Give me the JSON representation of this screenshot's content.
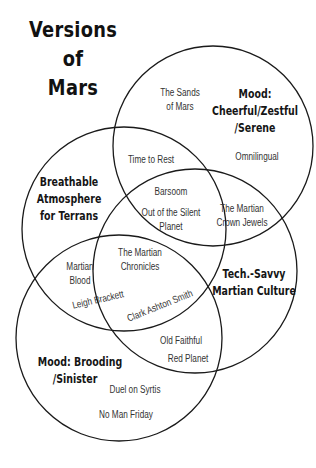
{
  "title": {
    "line1": "Versions",
    "line2": "of",
    "line3": "Mars"
  },
  "circles": [
    {
      "id": "cheerful",
      "cx": 213,
      "cy": 146,
      "r": 100
    },
    {
      "id": "breathable",
      "cx": 124,
      "cy": 229,
      "r": 102
    },
    {
      "id": "techsavvy",
      "cx": 195,
      "cy": 271,
      "r": 102
    },
    {
      "id": "brooding",
      "cx": 119,
      "cy": 338,
      "r": 103
    }
  ],
  "stroke_color": "#1a1a1a",
  "categories": {
    "cheerful": {
      "line1": "Mood:",
      "line2": "Cheerful/Zestful",
      "line3": "/Serene"
    },
    "breathable": {
      "line1": "Breathable",
      "line2": "Atmosphere",
      "line3": "for Terrans"
    },
    "techsavvy": {
      "line1": "Tech.-Savvy",
      "line2": "Martian Culture"
    },
    "brooding": {
      "line1": "Mood: Brooding",
      "line2": "/Sinister"
    }
  },
  "works": {
    "sands_of_mars": {
      "line1": "The Sands",
      "line2": "of Mars"
    },
    "omnilingual": "Omnilingual",
    "time_to_rest": "Time to Rest",
    "barsoom": "Barsoom",
    "out_of_silent_planet": {
      "line1": "Out of the Silent",
      "line2": "Planet"
    },
    "martian_crown_jewels": {
      "line1": "The Martian",
      "line2": "Crown Jewels"
    },
    "martian_chronicles": {
      "line1": "The Martian",
      "line2": "Chronicles"
    },
    "martian_blood": {
      "line1": "Martian",
      "line2": "Blood"
    },
    "leigh_brackett": "Leigh Brackett",
    "clark_ashton_smith": "Clark Ashton Smith",
    "old_faithful": "Old Faithful",
    "red_planet": "Red Planet",
    "duel_on_syrtis": "Duel on Syrtis",
    "no_man_friday": "No Man Friday"
  }
}
